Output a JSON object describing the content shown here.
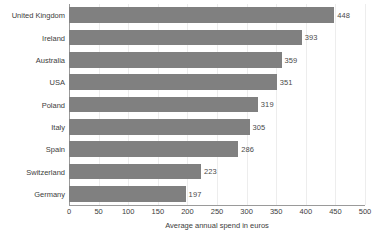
{
  "chart_data": {
    "type": "bar",
    "orientation": "horizontal",
    "title": "",
    "xlabel": "Average annual spend in euros",
    "ylabel": "",
    "categories": [
      "United Kingdom",
      "Ireland",
      "Australia",
      "USA",
      "Poland",
      "Italy",
      "Spain",
      "Switzerland",
      "Germany"
    ],
    "values": [
      448,
      393,
      359,
      351,
      319,
      305,
      286,
      223,
      197
    ],
    "xlim": [
      0,
      500
    ],
    "xticks": [
      0,
      50,
      100,
      150,
      200,
      250,
      300,
      350,
      400,
      450,
      500
    ],
    "xtick_labels": [
      "0",
      "50",
      "100",
      "150",
      "200",
      "250",
      "300",
      "350",
      "400",
      "450",
      "500"
    ],
    "data_labels": [
      "448",
      "393",
      "359",
      "351",
      "319",
      "305",
      "286",
      "223",
      "197"
    ],
    "grid": "vertical",
    "legend": "none",
    "bar_color": "#808080",
    "gridline_color": "#ededed",
    "axis_color": "#9a9a9a",
    "background_color": "#ffffff",
    "text_color": "#3d3d3d"
  }
}
